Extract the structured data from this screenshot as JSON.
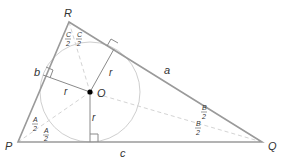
{
  "diagram": {
    "colors": {
      "triangle": "#9a9a9a",
      "circle": "#cfcfcf",
      "bisector": "#d4d4d4",
      "radius": "#8a8a8a",
      "center": "#000000",
      "text": "#333333"
    },
    "vertices": {
      "P": {
        "label": "P",
        "x": 18,
        "y": 142
      },
      "Q": {
        "label": "Q",
        "x": 262,
        "y": 142
      },
      "R": {
        "label": "R",
        "x": 69,
        "y": 22
      }
    },
    "sides": {
      "a": {
        "label": "a",
        "between": "R-Q"
      },
      "b": {
        "label": "b",
        "between": "P-R"
      },
      "c": {
        "label": "c",
        "between": "P-Q"
      }
    },
    "incircle": {
      "center_label": "O",
      "radius_label": "r",
      "cx": 90,
      "cy": 92,
      "r": 50
    },
    "radii_labels": [
      "r",
      "r",
      "r"
    ],
    "angle_labels": {
      "A": {
        "numerator": "A",
        "denominator": "2"
      },
      "B": {
        "numerator": "B",
        "denominator": "2"
      },
      "C": {
        "numerator": "C",
        "denominator": "2"
      }
    }
  }
}
